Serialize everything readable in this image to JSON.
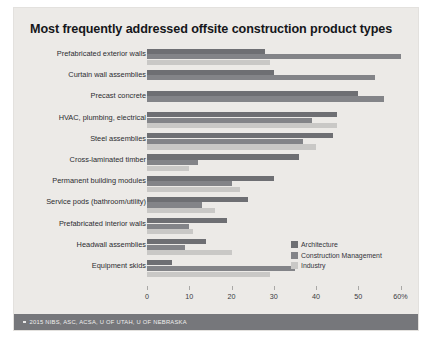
{
  "chart_data": {
    "type": "bar",
    "orientation": "horizontal",
    "title": "Most frequently addressed offsite construction product types",
    "xlabel": "",
    "ylabel": "",
    "xlim": [
      0,
      62
    ],
    "grid": false,
    "legend_position": "bottom-right",
    "tick_labels": [
      "0",
      "10",
      "20",
      "30",
      "40",
      "50",
      "60%"
    ],
    "tick_values": [
      0,
      10,
      20,
      30,
      40,
      50,
      60
    ],
    "categories": [
      "Prefabricated exterior walls",
      "Curtain wall assemblies",
      "Precast concrete",
      "HVAC, plumbing, electrical",
      "Steel assemblies",
      "Cross-laminated timber",
      "Permanent building modules",
      "Service pods (bathroom/utility)",
      "Prefabricated interior walls",
      "Headwall assemblies",
      "Equipment skids"
    ],
    "series": [
      {
        "name": "Architecture",
        "color": "#6e6f73",
        "values": [
          28,
          30,
          50,
          45,
          44,
          36,
          30,
          24,
          19,
          14,
          6
        ]
      },
      {
        "name": "Construction Management",
        "color": "#838488",
        "values": [
          60,
          54,
          56,
          39,
          37,
          12,
          20,
          13,
          10,
          9,
          35
        ]
      },
      {
        "name": "Industry",
        "color": "#c9c8c6",
        "values": [
          29,
          0,
          0,
          45,
          40,
          10,
          22,
          16,
          11,
          20,
          29
        ]
      }
    ]
  },
  "legend": {
    "items": [
      {
        "label": "Architecture",
        "color": "#6e6f73"
      },
      {
        "label": "Construction Management",
        "color": "#838488"
      },
      {
        "label": "Industry",
        "color": "#c9c8c6"
      }
    ]
  },
  "footer": {
    "text": "2015 NIBS, ASC, ACSA, U OF UTAH, U OF NEBRASKA"
  }
}
